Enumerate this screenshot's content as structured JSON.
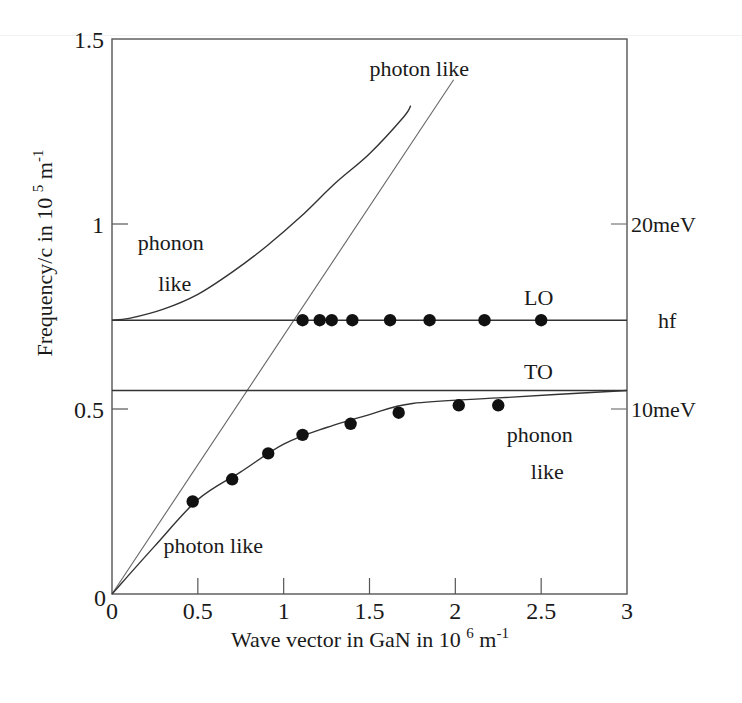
{
  "chart_data": {
    "type": "line",
    "title": "",
    "xlabel": "Wave vector in GaN in 10 6 m-1",
    "xlabel_parts": {
      "main": "Wave vector in GaN in 10",
      "exp": "6",
      "unit": "m",
      "unit_exp": "-1"
    },
    "ylabel": "Frequency/c in 10 5 m-1",
    "ylabel_parts": {
      "main": "Frequency/c in 10",
      "exp": "5",
      "unit": "m",
      "unit_exp": "-1"
    },
    "xlim": [
      0,
      3
    ],
    "ylim": [
      0,
      1.5
    ],
    "grid": false,
    "x_ticks": [
      {
        "value": 0,
        "label": "0"
      },
      {
        "value": 0.5,
        "label": "0.5"
      },
      {
        "value": 1,
        "label": "1"
      },
      {
        "value": 1.5,
        "label": "1.5"
      },
      {
        "value": 2,
        "label": "2"
      },
      {
        "value": 2.5,
        "label": "2.5"
      },
      {
        "value": 3,
        "label": "3"
      }
    ],
    "y_ticks": [
      {
        "value": 0,
        "label": "0"
      },
      {
        "value": 0.5,
        "label": "0.5"
      },
      {
        "value": 1,
        "label": "1"
      },
      {
        "value": 1.5,
        "label": "1.5"
      }
    ],
    "right_axis_ticks": [
      {
        "value": 0.5,
        "label": "10meV"
      },
      {
        "value": 1.0,
        "label": "20meV"
      },
      {
        "value": 0.74,
        "label": "hf",
        "tick": false
      }
    ],
    "series": [
      {
        "name": "photon line (light in vacuum/medium)",
        "style": "thin-line",
        "x": [
          0,
          1.99
        ],
        "y": [
          0,
          1.39
        ]
      },
      {
        "name": "LO level",
        "style": "line",
        "x": [
          0,
          3
        ],
        "y": [
          0.74,
          0.74
        ]
      },
      {
        "name": "TO level",
        "style": "line",
        "x": [
          0,
          3
        ],
        "y": [
          0.55,
          0.55
        ]
      },
      {
        "name": "upper polariton branch",
        "style": "line",
        "x": [
          0,
          0.1,
          0.3,
          0.5,
          0.7,
          0.9,
          1.1,
          1.3,
          1.5,
          1.7,
          1.74
        ],
        "y": [
          0.74,
          0.745,
          0.77,
          0.81,
          0.87,
          0.94,
          1.02,
          1.11,
          1.19,
          1.29,
          1.32
        ]
      },
      {
        "name": "lower polariton branch",
        "style": "line",
        "x": [
          0,
          0.25,
          0.5,
          0.75,
          1.0,
          1.25,
          1.5,
          1.75,
          2.25,
          3.0
        ],
        "y": [
          0,
          0.13,
          0.255,
          0.33,
          0.405,
          0.45,
          0.485,
          0.515,
          0.53,
          0.55
        ]
      },
      {
        "name": "LO measured",
        "style": "markers",
        "x": [
          1.11,
          1.21,
          1.28,
          1.4,
          1.62,
          1.85,
          2.17,
          2.5
        ],
        "y": [
          0.74,
          0.74,
          0.74,
          0.74,
          0.74,
          0.74,
          0.74,
          0.74
        ]
      },
      {
        "name": "lower branch measured",
        "style": "markers",
        "x": [
          0.47,
          0.7,
          0.91,
          1.11,
          1.39,
          1.67,
          2.02,
          2.25
        ],
        "y": [
          0.25,
          0.31,
          0.38,
          0.43,
          0.46,
          0.49,
          0.51,
          0.51
        ]
      }
    ],
    "annotations": [
      {
        "text": "photon like",
        "x": 1.5,
        "y": 1.4,
        "id": "top"
      },
      {
        "text": "phonon",
        "x": 0.15,
        "y": 0.93,
        "id": "upper_left_1"
      },
      {
        "text": "like",
        "x": 0.27,
        "y": 0.82,
        "id": "upper_left_2"
      },
      {
        "text": "LO",
        "x": 2.4,
        "y": 0.78,
        "id": "lo"
      },
      {
        "text": "TO",
        "x": 2.4,
        "y": 0.58,
        "id": "to"
      },
      {
        "text": "phonon",
        "x": 2.3,
        "y": 0.41,
        "id": "lower_right_1"
      },
      {
        "text": "like",
        "x": 2.44,
        "y": 0.31,
        "id": "lower_right_2"
      },
      {
        "text": "photon like",
        "x": 0.3,
        "y": 0.11,
        "id": "bottom"
      }
    ]
  }
}
